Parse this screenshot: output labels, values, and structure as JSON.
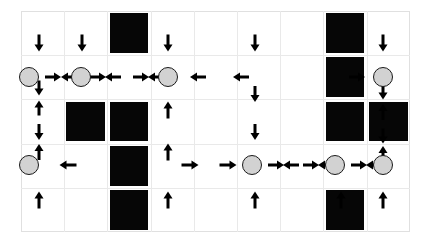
{
  "scene": {
    "title": "grid-world-policy-map",
    "canvas": {
      "width": 424,
      "height": 244
    },
    "background_color": "#ffffff",
    "grid": {
      "origin_x": 21,
      "origin_y": 11,
      "cols": 9,
      "rows": 5,
      "cell_width": 43.2,
      "cell_height": 44.2,
      "line_color": "#e9e9e9",
      "frame_color": "#e0e0e0"
    },
    "legend": {
      "obstacle_label": "obstacle",
      "agent_label": "agent",
      "arrow_label": "direction-arrow",
      "obstacle_color": "#060606",
      "agent_fill_color": "#d2d2d2",
      "agent_stroke_color": "#1a1a1a",
      "arrow_color": "#000000"
    },
    "obstacles": [
      {
        "col": 2,
        "row": 0
      },
      {
        "col": 7,
        "row": 0
      },
      {
        "col": 7,
        "row": 1
      },
      {
        "col": 1,
        "row": 2
      },
      {
        "col": 2,
        "row": 2
      },
      {
        "col": 7,
        "row": 2
      },
      {
        "col": 8,
        "row": 2
      },
      {
        "col": 2,
        "row": 3
      },
      {
        "col": 2,
        "row": 4
      },
      {
        "col": 7,
        "row": 4
      }
    ],
    "agents": [
      {
        "id": "agent-1",
        "x": 29,
        "y": 77,
        "d": 20
      },
      {
        "id": "agent-2",
        "x": 81,
        "y": 77,
        "d": 20
      },
      {
        "id": "agent-3",
        "x": 168,
        "y": 77,
        "d": 20
      },
      {
        "id": "agent-4",
        "x": 383,
        "y": 77,
        "d": 20
      },
      {
        "id": "agent-5",
        "x": 29,
        "y": 165,
        "d": 20
      },
      {
        "id": "agent-6",
        "x": 252,
        "y": 165,
        "d": 20
      },
      {
        "id": "agent-7",
        "x": 335,
        "y": 165,
        "d": 20
      },
      {
        "id": "agent-8",
        "x": 383,
        "y": 165,
        "d": 20
      }
    ],
    "arrows": [
      {
        "x": 39,
        "y": 43,
        "dir": "down",
        "len": 17
      },
      {
        "x": 82,
        "y": 43,
        "dir": "down",
        "len": 17
      },
      {
        "x": 168,
        "y": 43,
        "dir": "down",
        "len": 17
      },
      {
        "x": 255,
        "y": 43,
        "dir": "down",
        "len": 17
      },
      {
        "x": 383,
        "y": 43,
        "dir": "down",
        "len": 17
      },
      {
        "x": 53,
        "y": 77,
        "dir": "right",
        "len": 16
      },
      {
        "x": 69,
        "y": 77,
        "dir": "left",
        "len": 16
      },
      {
        "x": 98,
        "y": 77,
        "dir": "right",
        "len": 16
      },
      {
        "x": 113,
        "y": 77,
        "dir": "left",
        "len": 16
      },
      {
        "x": 141,
        "y": 77,
        "dir": "right",
        "len": 16
      },
      {
        "x": 156,
        "y": 77,
        "dir": "left",
        "len": 16
      },
      {
        "x": 198,
        "y": 77,
        "dir": "left",
        "len": 16
      },
      {
        "x": 241,
        "y": 77,
        "dir": "left",
        "len": 16
      },
      {
        "x": 357,
        "y": 77,
        "dir": "right",
        "len": 16
      },
      {
        "x": 39,
        "y": 88,
        "dir": "down",
        "len": 15
      },
      {
        "x": 39,
        "y": 108,
        "dir": "up",
        "len": 15
      },
      {
        "x": 168,
        "y": 110,
        "dir": "up",
        "len": 17
      },
      {
        "x": 255,
        "y": 94,
        "dir": "down",
        "len": 16
      },
      {
        "x": 383,
        "y": 92,
        "dir": "down",
        "len": 15
      },
      {
        "x": 383,
        "y": 112,
        "dir": "up",
        "len": 16
      },
      {
        "x": 39,
        "y": 132,
        "dir": "down",
        "len": 16
      },
      {
        "x": 255,
        "y": 132,
        "dir": "down",
        "len": 16
      },
      {
        "x": 383,
        "y": 136,
        "dir": "down",
        "len": 15
      },
      {
        "x": 39,
        "y": 152,
        "dir": "up",
        "len": 16
      },
      {
        "x": 168,
        "y": 152,
        "dir": "up",
        "len": 17
      },
      {
        "x": 383,
        "y": 154,
        "dir": "up",
        "len": 16
      },
      {
        "x": 68,
        "y": 165,
        "dir": "left",
        "len": 17
      },
      {
        "x": 190,
        "y": 165,
        "dir": "right",
        "len": 17
      },
      {
        "x": 228,
        "y": 165,
        "dir": "right",
        "len": 17
      },
      {
        "x": 276,
        "y": 165,
        "dir": "right",
        "len": 16
      },
      {
        "x": 291,
        "y": 165,
        "dir": "left",
        "len": 16
      },
      {
        "x": 311,
        "y": 165,
        "dir": "right",
        "len": 16
      },
      {
        "x": 326,
        "y": 165,
        "dir": "left",
        "len": 16
      },
      {
        "x": 359,
        "y": 165,
        "dir": "right",
        "len": 16
      },
      {
        "x": 374,
        "y": 165,
        "dir": "left",
        "len": 16
      },
      {
        "x": 39,
        "y": 200,
        "dir": "up",
        "len": 17
      },
      {
        "x": 168,
        "y": 200,
        "dir": "up",
        "len": 17
      },
      {
        "x": 255,
        "y": 200,
        "dir": "up",
        "len": 17
      },
      {
        "x": 341,
        "y": 200,
        "dir": "up",
        "len": 17
      },
      {
        "x": 383,
        "y": 200,
        "dir": "up",
        "len": 17
      }
    ]
  }
}
